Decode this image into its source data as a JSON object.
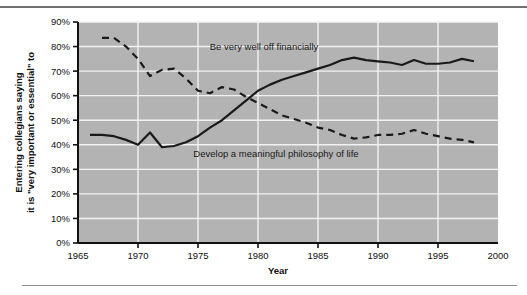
{
  "chart_data": {
    "type": "line",
    "title": "",
    "xlabel": "Year",
    "ylabel": "Entering collegians saying it is \"very important or essential\" to",
    "ylabel_line1": "Entering collegians saying",
    "ylabel_line2": "it is \"very important or essential\" to",
    "xlim": [
      1965,
      2000
    ],
    "ylim": [
      0,
      90
    ],
    "xticks": [
      1965,
      1970,
      1975,
      1980,
      1985,
      1990,
      1995,
      2000
    ],
    "xtick_labels": [
      "1965",
      "1970",
      "1975",
      "1980",
      "1985",
      "1990",
      "1995",
      "2000"
    ],
    "yticks": [
      0,
      10,
      20,
      30,
      40,
      50,
      60,
      70,
      80,
      90
    ],
    "ytick_labels": [
      "0%",
      "10%",
      "20%",
      "30%",
      "40%",
      "50%",
      "60%",
      "70%",
      "80%",
      "90%"
    ],
    "grid": "horizontal and vertical white gridlines",
    "legend": "inline labels on plot",
    "plot_bgcolor": "#b3b3b3",
    "gridcolor": "#f2f2f2",
    "linecolor": "#1a1a1a",
    "series": [
      {
        "name": "Be very well off financially",
        "style": "solid",
        "label_x": 1980.5,
        "label_y": 78.5,
        "x": [
          1966,
          1967,
          1968,
          1969,
          1970,
          1971,
          1972,
          1973,
          1974,
          1975,
          1976,
          1977,
          1978,
          1979,
          1980,
          1981,
          1982,
          1983,
          1984,
          1985,
          1986,
          1987,
          1988,
          1989,
          1990,
          1991,
          1992,
          1993,
          1994,
          1995,
          1996,
          1997,
          1998
        ],
        "y": [
          44.0,
          44.0,
          43.5,
          42.0,
          40.0,
          45.0,
          39.0,
          39.5,
          41.0,
          43.5,
          47.0,
          50.0,
          54.0,
          58.0,
          62.0,
          64.5,
          66.5,
          68.0,
          69.5,
          71.0,
          72.5,
          74.5,
          75.5,
          74.5,
          74.0,
          73.5,
          72.5,
          74.5,
          73.0,
          73.0,
          73.5,
          75.0,
          74.0
        ]
      },
      {
        "name": "Develop a meaningful philosophy of life",
        "style": "dashed",
        "label_x": 1981.5,
        "label_y": 35.0,
        "x": [
          1967,
          1968,
          1969,
          1970,
          1971,
          1972,
          1973,
          1974,
          1975,
          1976,
          1977,
          1978,
          1979,
          1980,
          1981,
          1982,
          1983,
          1984,
          1985,
          1986,
          1987,
          1988,
          1989,
          1990,
          1991,
          1992,
          1993,
          1994,
          1995,
          1996,
          1997,
          1998
        ],
        "y": [
          83.5,
          83.5,
          80.0,
          75.0,
          68.0,
          70.5,
          71.0,
          67.0,
          62.0,
          61.0,
          63.5,
          62.5,
          59.5,
          57.0,
          54.5,
          52.0,
          50.5,
          49.0,
          47.0,
          46.0,
          44.0,
          42.5,
          43.0,
          44.0,
          44.0,
          44.5,
          46.0,
          44.5,
          43.5,
          42.5,
          42.0,
          41.0
        ]
      }
    ]
  }
}
